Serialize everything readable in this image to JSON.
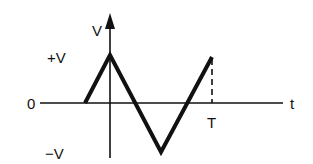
{
  "diagram": {
    "type": "triangular-waveform",
    "axes": {
      "vertical_label": "V",
      "horizontal_label": "t"
    },
    "levels": {
      "positive": "+V",
      "zero": "0",
      "negative": "−V"
    },
    "period_label": "T",
    "colors": {
      "stroke": "#111111",
      "background": "#ffffff"
    }
  }
}
